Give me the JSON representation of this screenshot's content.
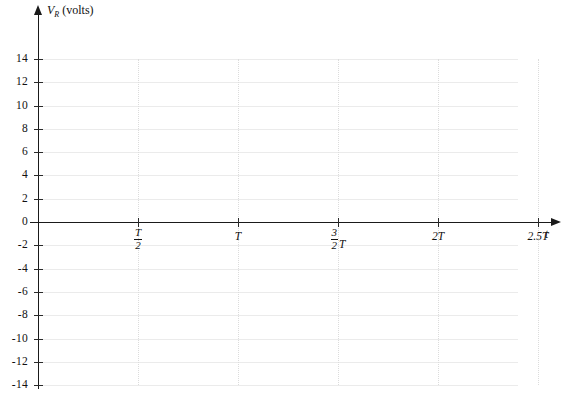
{
  "figure": {
    "type": "blank-graph-template",
    "background_color": "#ffffff",
    "axis_color": "#1a1a1a",
    "grid_color": "#ebebeb",
    "grid_v_color": "#dcdcdc"
  },
  "chart_data": {
    "type": "line",
    "title": "",
    "subtitle": "",
    "ylabel": "V_R (volts)",
    "ylabel_var": "V",
    "ylabel_sub": "R",
    "ylabel_unit": "(volts)",
    "xlabel": "t",
    "grid": true,
    "legend": null,
    "ylim": [
      -14,
      14
    ],
    "xlim": [
      0,
      2.5
    ],
    "y_ticks": [
      14,
      12,
      10,
      8,
      6,
      4,
      2,
      0,
      -2,
      -4,
      -6,
      -8,
      -10,
      -12,
      -14
    ],
    "y_tick_labels": [
      "14",
      "12",
      "10",
      "8",
      "6",
      "4",
      "2",
      "0",
      "-2",
      "-4",
      "-6",
      "-8",
      "-10",
      "-12",
      "-14"
    ],
    "x_ticks": [
      0.5,
      1.0,
      1.5,
      2.0,
      2.5
    ],
    "x_tick_labels": [
      "T/2",
      "T",
      "3/2 T",
      "2T",
      "2.5T"
    ],
    "series": [],
    "values": [],
    "categories": [],
    "annotations": [],
    "note": "Empty plotting grid with no data curve drawn"
  },
  "y_axis": {
    "ticks": [
      {
        "value": 14,
        "label": "14"
      },
      {
        "value": 12,
        "label": "12"
      },
      {
        "value": 10,
        "label": "10"
      },
      {
        "value": 8,
        "label": "8"
      },
      {
        "value": 6,
        "label": "6"
      },
      {
        "value": 4,
        "label": "4"
      },
      {
        "value": 2,
        "label": "2"
      },
      {
        "value": 0,
        "label": "0"
      },
      {
        "value": -2,
        "label": "-2"
      },
      {
        "value": -4,
        "label": "-4"
      },
      {
        "value": -6,
        "label": "-6"
      },
      {
        "value": -8,
        "label": "-8"
      },
      {
        "value": -10,
        "label": "-10"
      },
      {
        "value": -12,
        "label": "-12"
      },
      {
        "value": -14,
        "label": "-14"
      }
    ]
  },
  "x_axis": {
    "label": "t",
    "ticks": [
      {
        "value": 0.5,
        "kind": "fraction",
        "num": "T",
        "den": "2",
        "suffix": ""
      },
      {
        "value": 1.0,
        "kind": "plain",
        "text": "T"
      },
      {
        "value": 1.5,
        "kind": "fraction",
        "num": "3",
        "den": "2",
        "suffix": "T"
      },
      {
        "value": 2.0,
        "kind": "plain",
        "text": "2T"
      },
      {
        "value": 2.5,
        "kind": "plain",
        "text": "2.5T"
      }
    ]
  }
}
